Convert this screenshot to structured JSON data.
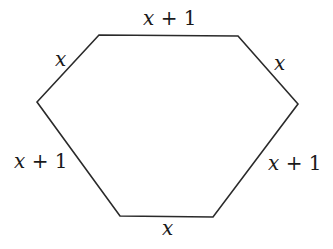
{
  "diagram": {
    "type": "hexagon",
    "stroke_color": "#2a2a2a",
    "vertices": [
      {
        "x": 99,
        "y": 35
      },
      {
        "x": 238,
        "y": 36
      },
      {
        "x": 298,
        "y": 104
      },
      {
        "x": 213,
        "y": 217
      },
      {
        "x": 120,
        "y": 216
      },
      {
        "x": 37,
        "y": 102
      }
    ],
    "sides": [
      {
        "name": "top",
        "var": "x",
        "rest": " + 1",
        "x": 143,
        "y": 25
      },
      {
        "name": "upper-right",
        "var": "x",
        "rest": "",
        "x": 274,
        "y": 70
      },
      {
        "name": "lower-right",
        "var": "x",
        "rest": " + 1",
        "x": 268,
        "y": 170
      },
      {
        "name": "bottom",
        "var": "x",
        "rest": "",
        "x": 162,
        "y": 235
      },
      {
        "name": "lower-left",
        "var": "x",
        "rest": " + 1",
        "x": 14,
        "y": 168
      },
      {
        "name": "upper-left",
        "var": "x",
        "rest": "",
        "x": 55,
        "y": 66
      }
    ]
  }
}
